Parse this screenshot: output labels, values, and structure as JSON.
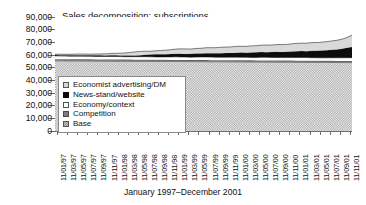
{
  "chart_data": {
    "type": "area",
    "title": "Sales decomposition: subscriptions",
    "xlabel": "January 1997–December 2001",
    "ylabel": "",
    "ylim": [
      0,
      90000
    ],
    "ytick_labels": [
      "90,000",
      "80,000",
      "70,000",
      "60,000",
      "50,000",
      "40,000",
      "30,000",
      "20,000",
      "10,000",
      "0"
    ],
    "ytick_values": [
      90000,
      80000,
      70000,
      60000,
      50000,
      40000,
      30000,
      20000,
      10000,
      0
    ],
    "grid": false,
    "legend_position": "inside-left",
    "stacked": true,
    "x_tick_labels": [
      "11/01/97",
      "11/03/97",
      "11/05/97",
      "11/07/97",
      "11/09/97",
      "11/11/97",
      "11/01/98",
      "11/03/98",
      "11/05/98",
      "11/07/98",
      "11/09/98",
      "11/11/98",
      "11/01/99",
      "11/03/99",
      "11/05/99",
      "11/07/99",
      "11/09/99",
      "11/11/99",
      "11/01/00",
      "11/03/00",
      "11/05/00",
      "11/07/00",
      "11/09/00",
      "11/11/00",
      "11/01/01",
      "11/03/01",
      "11/05/01",
      "11/07/01",
      "11/09/01",
      "11/11/01"
    ],
    "series": [
      {
        "name": "Base",
        "swatch": "hatched-gray",
        "values": [
          55400,
          55400,
          55350,
          55350,
          55300,
          55300,
          55250,
          55250,
          55200,
          55200,
          55150,
          55150,
          55100,
          55100,
          55050,
          55050,
          55000,
          55000,
          55000,
          54950,
          54950,
          54900,
          54900,
          54850,
          54850,
          54800,
          54800,
          54750,
          54750,
          54700,
          54700,
          54650,
          54650,
          54600,
          54600,
          54600,
          54550,
          54550,
          54500,
          54500,
          54450,
          54450,
          54400,
          54400,
          54350,
          54350,
          54300,
          54300,
          54250,
          54250,
          54200,
          54200,
          54150,
          54150,
          54100,
          54100,
          54050,
          54050,
          54000,
          54000
        ]
      },
      {
        "name": "Competition",
        "swatch": "dark-gray",
        "values": [
          1300,
          1300,
          1300,
          1300,
          1300,
          1300,
          1300,
          1300,
          1300,
          1300,
          1300,
          1300,
          1300,
          1300,
          1300,
          1300,
          1300,
          1300,
          1300,
          1300,
          1300,
          1300,
          1300,
          1300,
          1300,
          1300,
          1300,
          1300,
          1300,
          1300,
          1300,
          1300,
          1300,
          1300,
          1300,
          1300,
          1300,
          1300,
          1300,
          1300,
          1300,
          1300,
          1300,
          1300,
          1300,
          1300,
          1300,
          1300,
          1300,
          1300,
          1300,
          1300,
          1300,
          1300,
          1300,
          1300,
          1300,
          1300,
          1300,
          1300
        ]
      },
      {
        "name": "Economy/context",
        "swatch": "white",
        "values": [
          2600,
          2500,
          2500,
          2400,
          2500,
          2500,
          2450,
          2400,
          2400,
          2350,
          2400,
          2450,
          2400,
          2350,
          2300,
          2300,
          2350,
          2400,
          2400,
          2300,
          2250,
          2200,
          2300,
          2350,
          2400,
          2350,
          2300,
          2250,
          2300,
          2400,
          2450,
          2400,
          2350,
          2300,
          2350,
          2400,
          2450,
          2400,
          2350,
          2300,
          2350,
          2400,
          2450,
          2400,
          2350,
          2300,
          2350,
          2400,
          2450,
          2500,
          2450,
          2400,
          2350,
          2300,
          2350,
          2400,
          2450,
          2500,
          2550,
          2600
        ]
      },
      {
        "name": "News-stand/website",
        "swatch": "black",
        "values": [
          700,
          700,
          750,
          750,
          800,
          800,
          850,
          800,
          850,
          900,
          850,
          900,
          950,
          900,
          950,
          1000,
          1050,
          1100,
          1500,
          1800,
          2000,
          2200,
          2100,
          2300,
          2500,
          2600,
          2400,
          2600,
          2800,
          2700,
          2900,
          3100,
          3000,
          3200,
          3400,
          3300,
          3500,
          3700,
          3600,
          3800,
          4000,
          4200,
          4100,
          4300,
          4500,
          4400,
          4600,
          4800,
          5000,
          5200,
          5100,
          5400,
          5600,
          5800,
          6000,
          6300,
          6600,
          7000,
          7800,
          8500
        ]
      },
      {
        "name": "Economist advertising/DM",
        "swatch": "light-gray",
        "values": [
          600,
          700,
          650,
          700,
          800,
          900,
          850,
          900,
          1000,
          1100,
          1200,
          1400,
          1600,
          1800,
          2000,
          2400,
          2800,
          3000,
          2800,
          2600,
          2800,
          3000,
          3200,
          3400,
          3600,
          3800,
          4000,
          3800,
          4000,
          4200,
          4400,
          4300,
          4500,
          4700,
          4600,
          4800,
          5000,
          4900,
          5100,
          5300,
          5200,
          5400,
          5600,
          5500,
          5700,
          5900,
          5800,
          6000,
          6200,
          6100,
          6300,
          6500,
          6400,
          6600,
          6800,
          7000,
          7200,
          7600,
          8200,
          9200
        ]
      }
    ]
  }
}
